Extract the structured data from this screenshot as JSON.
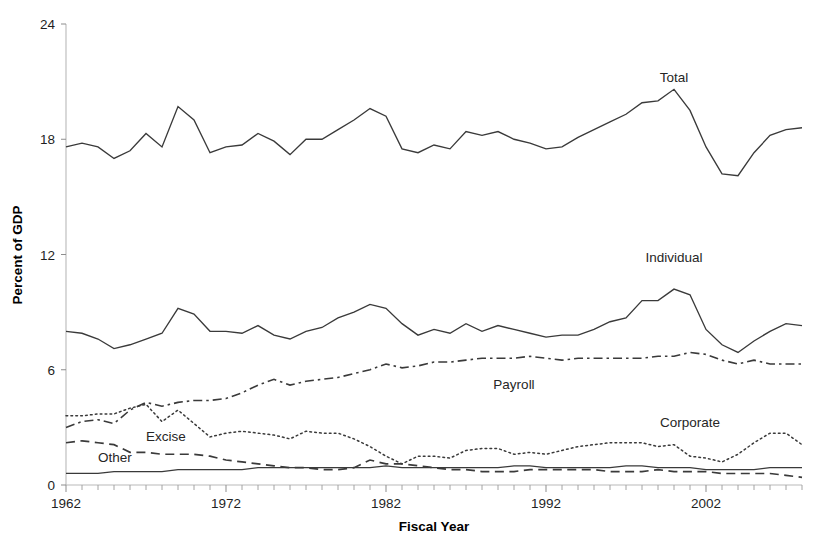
{
  "chart_data": {
    "type": "line",
    "title": "",
    "xlabel": "Fiscal Year",
    "ylabel": "Percent of GDP",
    "xlim": [
      1962,
      2008
    ],
    "ylim": [
      0,
      24
    ],
    "yticks": [
      0,
      6,
      12,
      18,
      24
    ],
    "xticks_labeled": [
      1962,
      1972,
      1982,
      1992,
      2002
    ],
    "xtick_minor_step": 1,
    "grid": false,
    "legend": "inline-labels",
    "x": [
      1962,
      1963,
      1964,
      1965,
      1966,
      1967,
      1968,
      1969,
      1970,
      1971,
      1972,
      1973,
      1974,
      1975,
      1976,
      1977,
      1978,
      1979,
      1980,
      1981,
      1982,
      1983,
      1984,
      1985,
      1986,
      1987,
      1988,
      1989,
      1990,
      1991,
      1992,
      1993,
      1994,
      1995,
      1996,
      1997,
      1998,
      1999,
      2000,
      2001,
      2002,
      2003,
      2004,
      2005,
      2006,
      2007,
      2008
    ],
    "series": [
      {
        "name": "Total",
        "style": "solid",
        "label_x": 2000,
        "label_y": 21.0,
        "values": [
          17.6,
          17.8,
          17.6,
          17.0,
          17.4,
          18.3,
          17.6,
          19.7,
          19.0,
          17.3,
          17.6,
          17.7,
          18.3,
          17.9,
          17.2,
          18.0,
          18.0,
          18.5,
          19.0,
          19.6,
          19.2,
          17.5,
          17.3,
          17.7,
          17.5,
          18.4,
          18.2,
          18.4,
          18.0,
          17.8,
          17.5,
          17.6,
          18.1,
          18.5,
          18.9,
          19.3,
          19.9,
          20.0,
          20.6,
          19.5,
          17.6,
          16.2,
          16.1,
          17.3,
          18.2,
          18.5,
          18.6
        ],
        "notes": "Total federal receipts as percent of GDP"
      },
      {
        "name": "Individual",
        "style": "solid",
        "label_x": 2000,
        "label_y": 11.6,
        "values": [
          8.0,
          7.9,
          7.6,
          7.1,
          7.3,
          7.6,
          7.9,
          9.2,
          8.9,
          8.0,
          8.0,
          7.9,
          8.3,
          7.8,
          7.6,
          8.0,
          8.2,
          8.7,
          9.0,
          9.4,
          9.2,
          8.4,
          7.8,
          8.1,
          7.9,
          8.4,
          8.0,
          8.3,
          8.1,
          7.9,
          7.7,
          7.8,
          7.8,
          8.1,
          8.5,
          8.7,
          9.6,
          9.6,
          10.2,
          9.9,
          8.1,
          7.3,
          6.9,
          7.5,
          8.0,
          8.4,
          8.3
        ],
        "notes": "Individual income taxes"
      },
      {
        "name": "Payroll",
        "style": "dash-dot",
        "label_x": 1990,
        "label_y": 5.0,
        "values": [
          3.0,
          3.3,
          3.4,
          3.2,
          3.9,
          4.3,
          4.1,
          4.3,
          4.4,
          4.4,
          4.5,
          4.8,
          5.2,
          5.5,
          5.2,
          5.4,
          5.5,
          5.6,
          5.8,
          6.0,
          6.3,
          6.1,
          6.2,
          6.4,
          6.4,
          6.5,
          6.6,
          6.6,
          6.6,
          6.7,
          6.6,
          6.5,
          6.6,
          6.6,
          6.6,
          6.6,
          6.6,
          6.7,
          6.7,
          6.9,
          6.8,
          6.5,
          6.3,
          6.5,
          6.3,
          6.3,
          6.3
        ],
        "notes": "Social insurance and retirement receipts"
      },
      {
        "name": "Corporate",
        "style": "dotted",
        "label_x": 2001,
        "label_y": 3.0,
        "values": [
          3.6,
          3.6,
          3.7,
          3.7,
          4.0,
          4.2,
          3.3,
          3.9,
          3.2,
          2.5,
          2.7,
          2.8,
          2.7,
          2.6,
          2.4,
          2.8,
          2.7,
          2.7,
          2.4,
          2.0,
          1.5,
          1.1,
          1.5,
          1.5,
          1.4,
          1.8,
          1.9,
          1.9,
          1.6,
          1.7,
          1.6,
          1.8,
          2.0,
          2.1,
          2.2,
          2.2,
          2.2,
          2.0,
          2.1,
          1.5,
          1.4,
          1.2,
          1.6,
          2.2,
          2.7,
          2.7,
          2.1
        ],
        "notes": "Corporation income taxes"
      },
      {
        "name": "Excise",
        "style": "dashed",
        "label_x": 1967,
        "label_y": 2.3,
        "values": [
          2.2,
          2.3,
          2.2,
          2.1,
          1.7,
          1.7,
          1.6,
          1.6,
          1.6,
          1.5,
          1.3,
          1.2,
          1.1,
          1.0,
          0.9,
          0.9,
          0.8,
          0.8,
          0.9,
          1.3,
          1.1,
          1.1,
          1.0,
          0.9,
          0.8,
          0.8,
          0.7,
          0.7,
          0.7,
          0.8,
          0.8,
          0.8,
          0.8,
          0.8,
          0.7,
          0.7,
          0.7,
          0.8,
          0.7,
          0.7,
          0.7,
          0.6,
          0.6,
          0.6,
          0.6,
          0.5,
          0.4
        ],
        "notes": "Excise taxes"
      },
      {
        "name": "Other",
        "style": "solid-thin",
        "label_x": 1964,
        "label_y": 1.2,
        "values": [
          0.6,
          0.6,
          0.6,
          0.7,
          0.7,
          0.7,
          0.7,
          0.8,
          0.8,
          0.8,
          0.8,
          0.8,
          0.9,
          0.9,
          0.9,
          0.9,
          0.9,
          0.9,
          0.9,
          0.9,
          1.0,
          0.9,
          0.9,
          0.9,
          0.9,
          0.9,
          0.9,
          0.9,
          1.0,
          1.0,
          0.9,
          0.9,
          0.9,
          0.9,
          0.9,
          1.0,
          1.0,
          0.9,
          0.9,
          0.9,
          0.8,
          0.8,
          0.8,
          0.8,
          0.9,
          0.9,
          0.9
        ],
        "notes": "Estate and gift, customs duties, miscellaneous receipts"
      }
    ]
  },
  "axes": {
    "y_title": "Percent of GDP",
    "x_title": "Fiscal Year",
    "y_tick_labels": [
      "0",
      "6",
      "12",
      "18",
      "24"
    ],
    "x_tick_labels": [
      "1962",
      "1972",
      "1982",
      "1992",
      "2002"
    ]
  },
  "series_labels": {
    "total": "Total",
    "individual": "Individual",
    "payroll": "Payroll",
    "corporate": "Corporate",
    "excise": "Excise",
    "other": "Other"
  },
  "colors": {
    "line": "#3a3a3a",
    "axis": "#b9b9b9",
    "text": "#1a1a1a",
    "background": "#ffffff"
  }
}
